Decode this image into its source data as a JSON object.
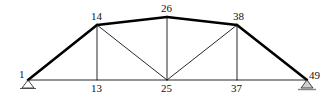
{
  "diagram": {
    "type": "truss",
    "colors": {
      "member": "#111111",
      "chord": "#000000",
      "support": "#333333",
      "ground": "#888888"
    },
    "nodes": [
      {
        "id": "1",
        "x": 28,
        "y": 80,
        "label": "1",
        "lx": 19,
        "ly": 78
      },
      {
        "id": "13",
        "x": 97,
        "y": 80,
        "label": "13",
        "lx": 91,
        "ly": 92
      },
      {
        "id": "25",
        "x": 167,
        "y": 80,
        "label": "25",
        "lx": 161,
        "ly": 92
      },
      {
        "id": "37",
        "x": 237,
        "y": 80,
        "label": "37",
        "lx": 231,
        "ly": 92
      },
      {
        "id": "49",
        "x": 307,
        "y": 80,
        "label": "49",
        "lx": 309,
        "ly": 79
      },
      {
        "id": "14",
        "x": 97,
        "y": 25,
        "label": "14",
        "lx": 91,
        "ly": 20
      },
      {
        "id": "26",
        "x": 167,
        "y": 17,
        "label": "26",
        "lx": 161,
        "ly": 12
      },
      {
        "id": "38",
        "x": 237,
        "y": 25,
        "label": "38",
        "lx": 233,
        "ly": 20
      }
    ],
    "members": [
      {
        "from": "1",
        "to": "14",
        "thick": true
      },
      {
        "from": "14",
        "to": "26",
        "thick": true
      },
      {
        "from": "26",
        "to": "38",
        "thick": true
      },
      {
        "from": "38",
        "to": "49",
        "thick": true
      },
      {
        "from": "1",
        "to": "49",
        "thick": false
      },
      {
        "from": "14",
        "to": "13",
        "thick": false
      },
      {
        "from": "26",
        "to": "25",
        "thick": false
      },
      {
        "from": "38",
        "to": "37",
        "thick": false
      },
      {
        "from": "14",
        "to": "25",
        "thick": false
      },
      {
        "from": "38",
        "to": "25",
        "thick": false
      }
    ],
    "supports": [
      {
        "node": "1",
        "type": "pin"
      },
      {
        "node": "49",
        "type": "roller"
      }
    ]
  }
}
